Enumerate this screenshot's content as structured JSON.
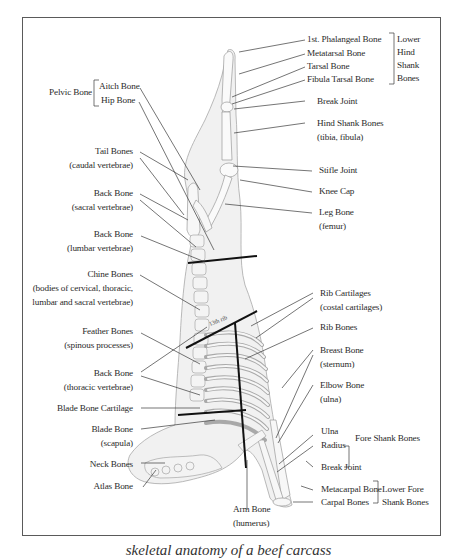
{
  "diagram": {
    "type": "anatomical skeletal diagram of beef carcass side",
    "inline_label": "13th rib",
    "caption_partial": "skeletal anatomy of a beef carcass"
  },
  "labels_left": {
    "pelvic_bone": "Pelvic Bone",
    "aitch_bone": "Aitch Bone",
    "hip_bone": "Hip Bone",
    "tail_bones": "Tail Bones",
    "tail_bones_sub": "(caudal vertebrae)",
    "back_bone_sacral": "Back Bone",
    "back_bone_sacral_sub": "(sacral vertebrae)",
    "back_bone_lumbar": "Back Bone",
    "back_bone_lumbar_sub": "(lumbar vertebrae)",
    "chine_bones": "Chine Bones",
    "chine_bones_sub1": "(bodies of cervical, thoracic,",
    "chine_bones_sub2": "lumbar and sacral vertebrae)",
    "feather_bones": "Feather Bones",
    "feather_bones_sub": "(spinous processes)",
    "back_bone_thoracic": "Back Bone",
    "back_bone_thoracic_sub": "(thoracic vertebrae)",
    "blade_bone_cartilage": "Blade Bone Cartilage",
    "blade_bone": "Blade Bone",
    "blade_bone_sub": "(scapula)",
    "neck_bones": "Neck Bones",
    "atlas_bone": "Atlas Bone"
  },
  "labels_right": {
    "first_phalangeal": "1st. Phalangeal Bone",
    "metatarsal": "Metatarsal Bone",
    "tarsal": "Tarsal Bone",
    "fibula_tarsal": "Fibula Tarsal Bone",
    "lower_hind_shank": [
      "Lower",
      "Hind",
      "Shank",
      "Bones"
    ],
    "break_joint_hind": "Break Joint",
    "hind_shank_bones": "Hind Shank Bones",
    "hind_shank_bones_sub": "(tibia, fibula)",
    "stifle_joint": "Stifle Joint",
    "knee_cap": "Knee Cap",
    "leg_bone": "Leg Bone",
    "leg_bone_sub": "(femur)",
    "rib_cartilages": "Rib Cartilages",
    "rib_cartilages_sub": "(costal cartilages)",
    "rib_bones": "Rib Bones",
    "breast_bone": "Breast Bone",
    "breast_bone_sub": "(sternum)",
    "elbow_bone": "Elbow Bone",
    "elbow_bone_sub": "(ulna)",
    "ulna": "Ulna",
    "radius": "Radius",
    "fore_shank_bones": "Fore Shank Bones",
    "break_joint_fore": "Break Joint",
    "metacarpal": "Metacarpal Bone",
    "carpal": "Carpal Bones",
    "lower_fore_shank_1": "Lower Fore",
    "lower_fore_shank_2": "Shank Bones"
  },
  "labels_bottom": {
    "arm_bone": "Arm Bone",
    "arm_bone_sub": "(humerus)"
  },
  "colors": {
    "frame": "#5a5a5a",
    "leader_line": "#3a3a3a",
    "cut_line": "#111111",
    "bone_fill": "#ededed",
    "bone_stroke": "#9a9a9a"
  }
}
